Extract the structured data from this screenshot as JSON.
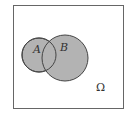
{
  "diagram": {
    "type": "venn",
    "universe": {
      "label": "Ω"
    },
    "sets": [
      {
        "label": "A",
        "fill": "#b3b3b3"
      },
      {
        "label": "B",
        "fill": "#b3b3b3"
      }
    ],
    "colors": {
      "border": "#555555",
      "fill": "#b3b3b3",
      "background": "#ffffff"
    }
  }
}
